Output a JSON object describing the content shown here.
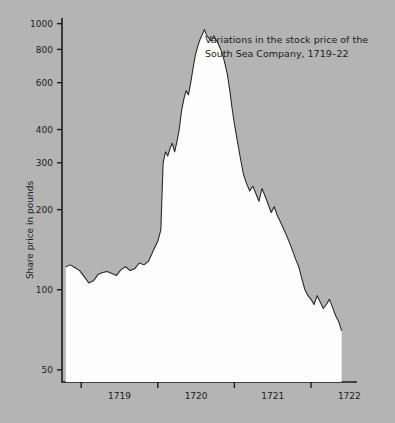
{
  "chart_data": {
    "type": "area",
    "title": "Variations in the stock price of the South Sea Company, 1719–22",
    "title_line1": "Variations in the stock price of the",
    "title_line2": "South Sea Company, 1719–22",
    "xlabel": "",
    "ylabel": "Share price in pounds",
    "yscale": "log",
    "ylim": [
      45,
      1050
    ],
    "yticks": [
      50,
      100,
      200,
      300,
      400,
      600,
      800,
      1000
    ],
    "ytick_labels": [
      "50",
      "100",
      "200",
      "300",
      "400",
      "600",
      "800",
      "1000"
    ],
    "xlim": [
      1718.75,
      1722.6
    ],
    "xticks": [
      1719,
      1720,
      1721,
      1722
    ],
    "xtick_labels": [
      "1719",
      "1720",
      "1721",
      "1722"
    ],
    "xtick_label_positions": [
      1719.5,
      1720.5,
      1721.5,
      1722.5
    ],
    "grid": false,
    "legend": null,
    "fill_color": "#fdfdfd",
    "line_color": "#242424",
    "background_color": "#b4b4b4",
    "series": [
      {
        "name": "South Sea Company share price",
        "x": [
          1718.8,
          1718.86,
          1718.92,
          1718.98,
          1719.04,
          1719.1,
          1719.16,
          1719.22,
          1719.28,
          1719.34,
          1719.4,
          1719.46,
          1719.52,
          1719.58,
          1719.64,
          1719.7,
          1719.76,
          1719.82,
          1719.88,
          1719.94,
          1720.0,
          1720.04,
          1720.07,
          1720.1,
          1720.13,
          1720.16,
          1720.19,
          1720.22,
          1720.25,
          1720.28,
          1720.31,
          1720.34,
          1720.37,
          1720.4,
          1720.43,
          1720.46,
          1720.49,
          1720.52,
          1720.55,
          1720.58,
          1720.61,
          1720.64,
          1720.67,
          1720.7,
          1720.73,
          1720.76,
          1720.79,
          1720.82,
          1720.85,
          1720.88,
          1720.91,
          1720.94,
          1720.97,
          1721.0,
          1721.04,
          1721.08,
          1721.12,
          1721.16,
          1721.2,
          1721.24,
          1721.28,
          1721.32,
          1721.36,
          1721.4,
          1721.44,
          1721.48,
          1721.52,
          1721.56,
          1721.6,
          1721.64,
          1721.68,
          1721.72,
          1721.76,
          1721.8,
          1721.84,
          1721.88,
          1721.92,
          1721.96,
          1722.0,
          1722.04,
          1722.08,
          1722.12,
          1722.16,
          1722.2,
          1722.24,
          1722.28,
          1722.32,
          1722.36,
          1722.4
        ],
        "y": [
          122,
          124,
          121,
          118,
          112,
          106,
          108,
          114,
          116,
          117,
          115,
          113,
          119,
          122,
          118,
          120,
          126,
          124,
          128,
          140,
          152,
          168,
          300,
          330,
          318,
          340,
          355,
          330,
          360,
          400,
          470,
          520,
          560,
          540,
          600,
          680,
          760,
          820,
          870,
          910,
          950,
          900,
          880,
          860,
          900,
          870,
          840,
          800,
          760,
          700,
          640,
          560,
          480,
          420,
          360,
          310,
          270,
          250,
          235,
          245,
          230,
          215,
          240,
          225,
          210,
          195,
          205,
          190,
          180,
          170,
          160,
          150,
          140,
          130,
          122,
          110,
          100,
          95,
          92,
          88,
          95,
          90,
          85,
          88,
          92,
          86,
          80,
          76,
          70
        ]
      }
    ],
    "annotations": []
  },
  "axis": {
    "y_title": "Share price in pounds"
  }
}
